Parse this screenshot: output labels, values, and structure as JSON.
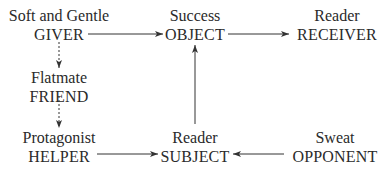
{
  "diagram": {
    "type": "actantial-model",
    "nodes": [
      {
        "id": "giver",
        "label": "Soft and Gentle",
        "role": "GIVER"
      },
      {
        "id": "object",
        "label": "Success",
        "role": "OBJECT"
      },
      {
        "id": "receiver",
        "label": "Reader",
        "role": "RECEIVER"
      },
      {
        "id": "friend",
        "label": "Flatmate",
        "role": "FRIEND"
      },
      {
        "id": "helper",
        "label": "Protagonist",
        "role": "HELPER"
      },
      {
        "id": "subject",
        "label": "Reader",
        "role": "SUBJECT"
      },
      {
        "id": "opponent",
        "label": "Sweat",
        "role": "OPPONENT"
      }
    ],
    "edges": [
      {
        "from": "giver",
        "to": "object",
        "style": "solid"
      },
      {
        "from": "object",
        "to": "receiver",
        "style": "solid"
      },
      {
        "from": "giver",
        "to": "friend",
        "style": "dashed"
      },
      {
        "from": "friend",
        "to": "helper",
        "style": "dashed"
      },
      {
        "from": "helper",
        "to": "subject",
        "style": "solid"
      },
      {
        "from": "opponent",
        "to": "subject",
        "style": "solid"
      },
      {
        "from": "subject",
        "to": "object",
        "style": "solid"
      }
    ],
    "colors": {
      "line": "#333333",
      "text": "#2a2a2a",
      "background": "#ffffff"
    }
  }
}
